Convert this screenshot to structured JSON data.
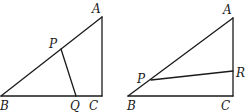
{
  "figures": [
    {
      "id": "left",
      "points": {
        "A": {
          "x": 102,
          "y": 17
        },
        "B": {
          "x": 1,
          "y": 96
        },
        "C": {
          "x": 102,
          "y": 96
        },
        "P": {
          "x": 61,
          "y": 49
        },
        "Q": {
          "x": 76,
          "y": 96
        }
      },
      "segments": [
        [
          "A",
          "B"
        ],
        [
          "B",
          "C"
        ],
        [
          "C",
          "A"
        ],
        [
          "P",
          "Q"
        ]
      ],
      "labels": [
        {
          "text": "A",
          "x": 92,
          "y": 13
        },
        {
          "text": "P",
          "x": 49,
          "y": 48
        },
        {
          "text": "B",
          "x": 0,
          "y": 110
        },
        {
          "text": "Q",
          "x": 70,
          "y": 110
        },
        {
          "text": "C",
          "x": 89,
          "y": 110
        }
      ]
    },
    {
      "id": "right",
      "points": {
        "A": {
          "x": 233,
          "y": 18
        },
        "B": {
          "x": 128,
          "y": 96
        },
        "C": {
          "x": 233,
          "y": 96
        },
        "P": {
          "x": 151,
          "y": 80
        },
        "R": {
          "x": 233,
          "y": 71
        }
      },
      "segments": [
        [
          "A",
          "B"
        ],
        [
          "B",
          "C"
        ],
        [
          "C",
          "A"
        ],
        [
          "P",
          "R"
        ]
      ],
      "labels": [
        {
          "text": "A",
          "x": 223,
          "y": 14
        },
        {
          "text": "P",
          "x": 137,
          "y": 83
        },
        {
          "text": "R",
          "x": 236,
          "y": 77
        },
        {
          "text": "B",
          "x": 127,
          "y": 110
        },
        {
          "text": "C",
          "x": 221,
          "y": 110
        }
      ]
    }
  ]
}
